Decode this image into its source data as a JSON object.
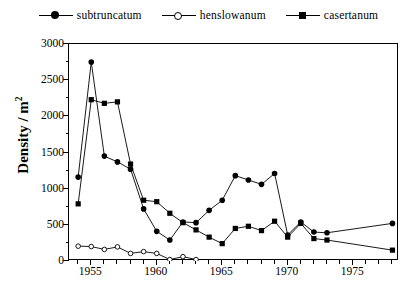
{
  "legend": {
    "position": "top-center",
    "items": [
      {
        "label": "subtruncatum",
        "marker": "filled-circle",
        "color": "#000000"
      },
      {
        "label": "henslowanum",
        "marker": "open-circle",
        "color": "#000000"
      },
      {
        "label": "casertanum",
        "marker": "filled-square",
        "color": "#000000"
      }
    ]
  },
  "axes": {
    "ylabel_text": "Density / m",
    "ylabel_exponent": "2",
    "ytick_labels": [
      "3000",
      "2500",
      "2000",
      "1500",
      "1000",
      "500",
      "0"
    ],
    "xtick_labels": [
      "1955",
      "1960",
      "1965",
      "1970",
      "1975"
    ]
  },
  "chart_data": {
    "type": "line",
    "title": "",
    "xlabel": "",
    "ylabel": "Density / m 2",
    "xlim": [
      1953.3,
      1978.5
    ],
    "ylim": [
      0,
      3000
    ],
    "ytick_values": [
      0,
      500,
      1000,
      1500,
      2000,
      2500,
      3000
    ],
    "xtick_values": [
      1955,
      1960,
      1965,
      1970,
      1975
    ],
    "xminor_step": 1,
    "grid": false,
    "legend_position": "top-center",
    "series": [
      {
        "name": "subtruncatum",
        "marker": "filled-circle",
        "color": "#000000",
        "x": [
          1954,
          1955,
          1956,
          1957,
          1958,
          1959,
          1960,
          1961,
          1962,
          1963,
          1964,
          1965,
          1966,
          1967,
          1968,
          1969,
          1970,
          1971,
          1972,
          1973,
          1978
        ],
        "y": [
          1160,
          2750,
          1450,
          1370,
          1270,
          720,
          410,
          290,
          540,
          530,
          700,
          840,
          1180,
          1120,
          1060,
          1210,
          360,
          540,
          400,
          390,
          520
        ]
      },
      {
        "name": "henslowanum",
        "marker": "open-circle",
        "color": "#000000",
        "x": [
          1954,
          1955,
          1956,
          1957,
          1958,
          1959,
          1960,
          1961,
          1962,
          1963
        ],
        "y": [
          205,
          200,
          160,
          195,
          105,
          130,
          105,
          20,
          60,
          20
        ]
      },
      {
        "name": "casertanum",
        "marker": "filled-square",
        "color": "#000000",
        "x": [
          1954,
          1955,
          1956,
          1957,
          1958,
          1959,
          1960,
          1961,
          1962,
          1963,
          1964,
          1965,
          1966,
          1967,
          1968,
          1969,
          1970,
          1971,
          1972,
          1973,
          1978
        ],
        "y": [
          790,
          2230,
          2180,
          2200,
          1340,
          840,
          820,
          660,
          530,
          430,
          330,
          240,
          450,
          480,
          420,
          550,
          330,
          520,
          310,
          290,
          150
        ]
      }
    ]
  }
}
